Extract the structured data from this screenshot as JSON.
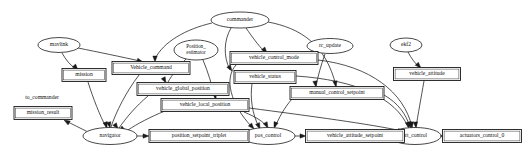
{
  "graph": {
    "title": "PX4 module and uORB topic dependency graph",
    "background_color": "#ffffff",
    "line_color": "#1a1a1a",
    "free_labels": [
      {
        "id": "to_commander",
        "text": "to_commander",
        "x": 42,
        "y": 98,
        "size": 5.6
      }
    ],
    "nodes": [
      {
        "id": "commander",
        "label": "commander",
        "shape": "ellipse",
        "x": 240,
        "y": 20,
        "rx": 29,
        "ry": 8,
        "size": 5.6
      },
      {
        "id": "mavlink",
        "label": "mavlink",
        "shape": "ellipse",
        "x": 59,
        "y": 45,
        "rx": 21,
        "ry": 7.5,
        "size": 5.6
      },
      {
        "id": "position_estimator",
        "label": "Position_\nestimator",
        "shape": "ellipse",
        "x": 196,
        "y": 50,
        "rx": 22,
        "ry": 10,
        "size": 5.2
      },
      {
        "id": "rc_update",
        "label": "rc_update",
        "shape": "ellipse",
        "x": 330,
        "y": 46,
        "rx": 23,
        "ry": 7.5,
        "size": 5.6
      },
      {
        "id": "ekf2",
        "label": "ekf2",
        "shape": "ellipse",
        "x": 406,
        "y": 45,
        "rx": 16,
        "ry": 7,
        "size": 5.6
      },
      {
        "id": "navigator",
        "label": "navigator",
        "shape": "ellipse",
        "x": 110,
        "y": 136,
        "rx": 27,
        "ry": 8.5,
        "size": 5.6
      },
      {
        "id": "pos_control",
        "label": "pos_control",
        "shape": "ellipse",
        "x": 268,
        "y": 136,
        "rx": 27,
        "ry": 8.5,
        "size": 5.6
      },
      {
        "id": "att_control",
        "label": "att_control",
        "shape": "ellipse",
        "x": 415,
        "y": 136,
        "rx": 26,
        "ry": 8.5,
        "size": 5.6
      },
      {
        "id": "mission",
        "label": "mission",
        "shape": "box",
        "x": 84,
        "y": 75,
        "w": 44,
        "h": 13,
        "size": 5.6
      },
      {
        "id": "mission_result",
        "label": "mission_result",
        "shape": "box",
        "x": 43,
        "y": 113,
        "w": 58,
        "h": 13,
        "size": 5.6
      },
      {
        "id": "Vehicle_command",
        "label": "Vehicle_command",
        "shape": "box",
        "x": 151,
        "y": 68,
        "w": 78,
        "h": 13,
        "size": 5.6
      },
      {
        "id": "vehicle_global_position",
        "label": "vehicle_global_position",
        "shape": "box",
        "x": 183,
        "y": 89,
        "w": 92,
        "h": 13,
        "size": 5.6
      },
      {
        "id": "vehicle_local_position",
        "label": "vehicle_local_position",
        "shape": "box",
        "x": 205,
        "y": 105,
        "w": 88,
        "h": 13,
        "size": 5.6
      },
      {
        "id": "vehicle_control_mode",
        "label": "vehicle_control_mode",
        "shape": "box",
        "x": 274,
        "y": 58,
        "w": 88,
        "h": 13,
        "size": 5.6
      },
      {
        "id": "vehicle_status",
        "label": "vehicle_status",
        "shape": "box",
        "x": 265,
        "y": 77,
        "w": 62,
        "h": 13,
        "size": 5.6
      },
      {
        "id": "manual_control_setpoint",
        "label": "manual_control_setpoint",
        "shape": "box",
        "x": 337,
        "y": 93,
        "w": 94,
        "h": 13,
        "size": 5.6
      },
      {
        "id": "vehicle_attitude",
        "label": "vehicle_attitude",
        "shape": "box",
        "x": 427,
        "y": 74,
        "w": 67,
        "h": 13,
        "size": 5.6
      },
      {
        "id": "position_setpoint_triplet",
        "label": "position_setpoint_triplet",
        "shape": "box",
        "x": 199,
        "y": 136,
        "w": 100,
        "h": 13,
        "size": 5.6
      },
      {
        "id": "vehicle_attitude_setpoint",
        "label": "vehicle_attitude_setpoint",
        "shape": "box",
        "x": 355,
        "y": 136,
        "w": 99,
        "h": 13,
        "size": 5.6
      },
      {
        "id": "actuators_control_0",
        "label": "actuators_control_0",
        "shape": "box",
        "x": 482,
        "y": 136,
        "w": 79,
        "h": 13,
        "size": 5.6
      }
    ],
    "edges": [
      {
        "from": "commander",
        "to": "Vehicle_command",
        "path": "M 212 23 C 186 29 163 42 155 59",
        "arrow": [
          155,
          62,
          90
        ]
      },
      {
        "from": "commander",
        "to": "vehicle_control_mode",
        "path": "M 246 28 C 253 38 258 45 264 51",
        "arrow": [
          267,
          53,
          50
        ]
      },
      {
        "from": "commander",
        "to": "vehicle_status",
        "path": "M 231 28 C 224 40 223 56 230 70",
        "arrow": [
          232,
          71,
          55
        ]
      },
      {
        "from": "commander",
        "to": "manual_control_setpoint",
        "path": "M 268 22 C 300 28 326 44 336 86",
        "arrow": [
          336,
          87,
          80
        ]
      },
      {
        "from": "mavlink",
        "to": "mission",
        "path": "M 62 53 C 66 60 70 65 76 69",
        "arrow": [
          78,
          70,
          48
        ]
      },
      {
        "from": "mavlink",
        "to": "Vehicle_command",
        "path": "M 78 48 C 98 52 122 57 140 61",
        "arrow": [
          143,
          62,
          16
        ]
      },
      {
        "from": "position_estimator",
        "to": "vehicle_global_position",
        "path": "M 186 59 C 178 67 172 75 168 82",
        "arrow": [
          166,
          83,
          62
        ]
      },
      {
        "from": "position_estimator",
        "to": "vehicle_local_position",
        "path": "M 203 60 C 208 72 212 85 215 98",
        "arrow": [
          216,
          99,
          74
        ]
      },
      {
        "from": "rc_update",
        "to": "manual_control_setpoint",
        "path": "M 325 54 C 321 65 318 76 316 86",
        "arrow": [
          316,
          87,
          80
        ]
      },
      {
        "from": "ekf2",
        "to": "vehicle_attitude",
        "path": "M 408 52 C 411 58 415 63 419 67",
        "arrow": [
          421,
          68,
          45
        ]
      },
      {
        "from": "mission",
        "to": "navigator",
        "path": "M 88 82 C 93 98 100 116 106 127",
        "arrow": [
          107,
          128,
          72
        ]
      },
      {
        "from": "Vehicle_command",
        "to": "navigator",
        "path": "M 139 75 C 126 92 116 112 111 127",
        "arrow": [
          110,
          128,
          78
        ]
      },
      {
        "from": "vehicle_global_position",
        "to": "navigator",
        "path": "M 148 96 C 136 106 126 118 119 128",
        "arrow": [
          118,
          129,
          55
        ]
      },
      {
        "from": "vehicle_local_position",
        "to": "navigator",
        "path": "M 165 111 C 150 117 137 124 128 130",
        "arrow": [
          126,
          131,
          30
        ]
      },
      {
        "from": "navigator",
        "to": "mission_result",
        "path": "M 88 132 C 80 128 72 124 66 121",
        "arrow": [
          64,
          120,
          210
        ]
      },
      {
        "from": "navigator",
        "to": "position_setpoint_triplet",
        "path": "M 137 136 L 146 136",
        "arrow": [
          149,
          136,
          0
        ]
      },
      {
        "from": "position_setpoint_triplet",
        "to": "pos_control",
        "path": "M 249 136 L 238 136",
        "arrow": [
          241,
          136,
          0
        ]
      },
      {
        "from": "vehicle_control_mode",
        "to": "pos_control",
        "path": "M 236 65 C 224 78 230 104 252 127",
        "arrow": [
          254,
          129,
          48
        ]
      },
      {
        "from": "vehicle_status",
        "to": "pos_control",
        "path": "M 252 84 C 250 97 252 114 259 127",
        "arrow": [
          260,
          129,
          66
        ]
      },
      {
        "from": "vehicle_local_position",
        "to": "pos_control",
        "path": "M 244 112 C 256 117 264 122 267 127",
        "arrow": [
          268,
          128,
          62
        ]
      },
      {
        "from": "manual_control_setpoint",
        "to": "pos_control",
        "path": "M 292 99 C 284 108 279 118 275 127",
        "arrow": [
          274,
          128,
          110
        ]
      },
      {
        "from": "pos_control",
        "to": "vehicle_attitude_setpoint",
        "path": "M 295 136 L 303 136",
        "arrow": [
          306,
          136,
          0
        ]
      },
      {
        "from": "vehicle_attitude_setpoint",
        "to": "att_control",
        "path": "M 405 136 L 386 136",
        "arrow": [
          389,
          136,
          0
        ]
      },
      {
        "from": "vehicle_attitude",
        "to": "att_control",
        "path": "M 424 81 C 421 98 418 115 416 127",
        "arrow": [
          416,
          128,
          85
        ]
      },
      {
        "from": "vehicle_control_mode",
        "to": "att_control",
        "path": "M 318 60 C 370 66 404 92 412 127",
        "arrow": [
          412,
          128,
          84
        ]
      },
      {
        "from": "vehicle_status",
        "to": "att_control",
        "path": "M 296 76 C 356 80 396 98 408 127",
        "arrow": [
          409,
          128,
          75
        ]
      },
      {
        "from": "manual_control_setpoint",
        "to": "att_control",
        "path": "M 384 95 C 398 103 406 114 410 127",
        "arrow": [
          411,
          128,
          72
        ]
      },
      {
        "from": "vehicle_local_position",
        "to": "att_control",
        "path": "M 249 108 C 310 116 370 124 402 131",
        "arrow": [
          404,
          132,
          12
        ]
      },
      {
        "from": "att_control",
        "to": "actuators_control_0",
        "path": "M 441 136 L 438 136",
        "arrow": [
          443,
          136,
          0
        ]
      }
    ]
  }
}
